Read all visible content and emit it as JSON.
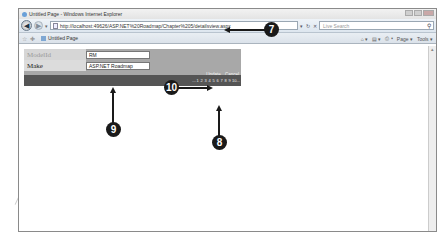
{
  "browser": {
    "window_title": "Untitled Page - Windows Internet Explorer",
    "address_url": "http://localhost:49626/ASP.NET%20Roadmap/Chapter%205/detailsview.aspx",
    "search_placeholder": "Live Search",
    "tab_title": "Untitled Page",
    "command_bar": {
      "home": "⌂ ▾",
      "feeds": "▤ ▾",
      "print": "⎙ ▾",
      "page_label": "Page ▾",
      "tools_label": "Tools ▾"
    }
  },
  "detailsview": {
    "rows": [
      {
        "label": "ModelId",
        "value": "RM"
      },
      {
        "label": "Make",
        "value": "ASP.NET Roadmap"
      }
    ],
    "commands": {
      "update": "Update",
      "cancel": "Cancel"
    },
    "pager": [
      "…",
      "1",
      "2",
      "3",
      "4",
      "5",
      "6",
      "7",
      "8",
      "9",
      "10",
      "…"
    ]
  },
  "callouts": {
    "c7": "7",
    "c8": "8",
    "c9": "9",
    "c10": "10"
  },
  "colors": {
    "detailsview_bg": "#a8a8a8",
    "pager_bg": "#555555",
    "callout": "#1a1a1a"
  }
}
